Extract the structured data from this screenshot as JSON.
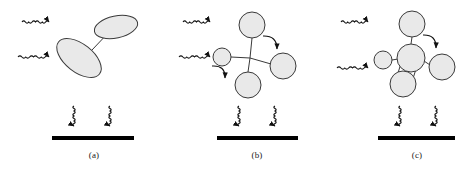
{
  "figure": {
    "background_color": "#ffffff",
    "shape_fill_color": "#e9e9e9",
    "shape_stroke_color": "#3a3a3a",
    "bond_color": "#3a3a3a",
    "arrow_color": "#111111",
    "substrate_color": "#000000",
    "panel_count": 3
  },
  "panels": [
    {
      "id": "a",
      "caption": "(a)",
      "description": "two tilted ellipses joined by a single bond",
      "particles": [
        {
          "name": "ellipse-upper",
          "shape": "ellipse",
          "cx": 116,
          "cy": 27,
          "rx": 22,
          "ry": 11,
          "rotation": -12
        },
        {
          "name": "ellipse-lower",
          "shape": "ellipse",
          "cx": 79,
          "cy": 58,
          "rx": 26,
          "ry": 14,
          "rotation": 38
        }
      ],
      "bonds": [
        {
          "name": "bond-lower-to-upper",
          "x1": 92,
          "y1": 50,
          "x2": 110,
          "y2": 31,
          "style": "single"
        }
      ],
      "incoming_arrows": [
        {
          "name": "incoming-arrow-top",
          "x": 22,
          "y": 22,
          "length": 34,
          "direction": "right"
        },
        {
          "name": "incoming-arrow-bottom",
          "x": 18,
          "y": 57,
          "length": 38,
          "direction": "right"
        }
      ],
      "internal_arrows": [],
      "outgoing_arrows": [
        {
          "name": "outgoing-arrow-left",
          "x": 74,
          "y": 106,
          "length": 26,
          "direction": "down"
        },
        {
          "name": "outgoing-arrow-right",
          "x": 110,
          "y": 106,
          "length": 26,
          "direction": "down"
        }
      ],
      "substrate": {
        "name": "substrate-bar",
        "x": 52,
        "y": 136,
        "width": 82,
        "height": 4
      }
    },
    {
      "id": "b",
      "caption": "(b)",
      "description": "four spheres radiating from a central vertex",
      "particles": [
        {
          "name": "sphere-top",
          "shape": "circle",
          "cx": 252,
          "cy": 25,
          "rx": 13,
          "ry": 13,
          "rotation": 0
        },
        {
          "name": "sphere-left",
          "shape": "circle",
          "cx": 222,
          "cy": 57,
          "rx": 9,
          "ry": 9,
          "rotation": 0
        },
        {
          "name": "sphere-right",
          "shape": "circle",
          "cx": 283,
          "cy": 66,
          "rx": 13,
          "ry": 13,
          "rotation": 0
        },
        {
          "name": "sphere-bottom",
          "shape": "circle",
          "cx": 248,
          "cy": 85,
          "rx": 13,
          "ry": 13,
          "rotation": 0
        }
      ],
      "bonds": [
        {
          "name": "bond-center-top",
          "x1": 250,
          "y1": 58,
          "x2": 252,
          "y2": 38,
          "style": "single"
        },
        {
          "name": "bond-center-left",
          "x1": 250,
          "y1": 58,
          "x2": 231,
          "y2": 57,
          "style": "single"
        },
        {
          "name": "bond-center-right",
          "x1": 250,
          "y1": 58,
          "x2": 271,
          "y2": 64,
          "style": "single"
        },
        {
          "name": "bond-center-bottom",
          "x1": 250,
          "y1": 58,
          "x2": 248,
          "y2": 72,
          "style": "single"
        }
      ],
      "incoming_arrows": [
        {
          "name": "incoming-arrow-top",
          "x": 183,
          "y": 22,
          "length": 34,
          "direction": "right"
        },
        {
          "name": "incoming-arrow-bottom",
          "x": 179,
          "y": 57,
          "length": 38,
          "direction": "right"
        }
      ],
      "internal_arrows": [
        {
          "name": "internal-arrow-upper-right",
          "x1": 263,
          "y1": 36,
          "x2": 281,
          "y2": 53,
          "direction": "down-right"
        },
        {
          "name": "internal-arrow-lower-left",
          "x1": 212,
          "y1": 66,
          "x2": 229,
          "y2": 82,
          "direction": "down-right"
        }
      ],
      "outgoing_arrows": [
        {
          "name": "outgoing-arrow-left",
          "x": 239,
          "y": 106,
          "length": 26,
          "direction": "down"
        },
        {
          "name": "outgoing-arrow-right",
          "x": 275,
          "y": 106,
          "length": 26,
          "direction": "down"
        }
      ],
      "substrate": {
        "name": "substrate-bar",
        "x": 217,
        "y": 136,
        "width": 81,
        "height": 4
      }
    },
    {
      "id": "c",
      "caption": "(c)",
      "description": "cluster with large central sphere and a cylinder bond to the lower sphere",
      "particles": [
        {
          "name": "sphere-top",
          "shape": "circle",
          "cx": 412,
          "cy": 24,
          "rx": 13,
          "ry": 13,
          "rotation": 0
        },
        {
          "name": "sphere-center",
          "shape": "circle",
          "cx": 411,
          "cy": 58,
          "rx": 14,
          "ry": 14,
          "rotation": 0
        },
        {
          "name": "sphere-left",
          "shape": "circle",
          "cx": 383,
          "cy": 60,
          "rx": 9,
          "ry": 9,
          "rotation": 0
        },
        {
          "name": "sphere-right",
          "shape": "circle",
          "cx": 442,
          "cy": 67,
          "rx": 13,
          "ry": 13,
          "rotation": 0
        },
        {
          "name": "sphere-bottom",
          "shape": "circle",
          "cx": 403,
          "cy": 84,
          "rx": 13,
          "ry": 13,
          "rotation": 0
        }
      ],
      "bonds": [
        {
          "name": "bond-center-top",
          "x1": 411,
          "y1": 44,
          "x2": 412,
          "y2": 37,
          "style": "single"
        },
        {
          "name": "bond-center-left",
          "x1": 398,
          "y1": 59,
          "x2": 392,
          "y2": 60,
          "style": "single"
        },
        {
          "name": "bond-center-right",
          "x1": 424,
          "y1": 61,
          "x2": 430,
          "y2": 65,
          "style": "single"
        },
        {
          "name": "bond-center-bottom",
          "x1": 405,
          "y1": 70,
          "x2": 403,
          "y2": 72,
          "style": "cylinder"
        }
      ],
      "incoming_arrows": [
        {
          "name": "incoming-arrow-top",
          "x": 341,
          "y": 22,
          "length": 34,
          "direction": "right"
        },
        {
          "name": "incoming-arrow-bottom",
          "x": 337,
          "y": 68,
          "length": 38,
          "direction": "right"
        }
      ],
      "internal_arrows": [
        {
          "name": "internal-arrow-upper-right",
          "x1": 423,
          "y1": 35,
          "x2": 440,
          "y2": 52,
          "direction": "down-right"
        }
      ],
      "outgoing_arrows": [
        {
          "name": "outgoing-arrow-left",
          "x": 400,
          "y": 106,
          "length": 26,
          "direction": "down"
        },
        {
          "name": "outgoing-arrow-right",
          "x": 436,
          "y": 106,
          "length": 26,
          "direction": "down"
        }
      ],
      "substrate": {
        "name": "substrate-bar",
        "x": 378,
        "y": 136,
        "width": 77,
        "height": 4
      }
    }
  ]
}
